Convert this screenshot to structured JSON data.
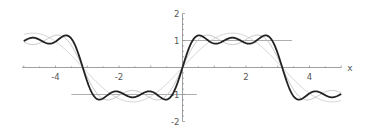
{
  "chart_data": {
    "type": "line",
    "title": "",
    "xlabel": "x",
    "ylabel": "",
    "xlim": [
      -5.0,
      5.0
    ],
    "ylim": [
      -2,
      2
    ],
    "grid": false,
    "legend": null,
    "x_ticks": [
      -4,
      -2,
      2,
      4
    ],
    "x_tick_labels": [
      "-4",
      "-2",
      "2",
      "4"
    ],
    "y_ticks": [
      -2,
      -1,
      1,
      2
    ],
    "y_tick_labels": [
      "-2",
      "-1",
      "1",
      "2"
    ],
    "series": [
      {
        "name": "partial sum, 1 term",
        "formula": "(4/pi) sin x",
        "terms": 1,
        "color": "#cccccc",
        "width": 0.9
      },
      {
        "name": "partial sum, 2 terms",
        "formula": "(4/pi)(sin x + sin 3x / 3)",
        "terms": 2,
        "color": "#bbbbbb",
        "width": 0.9
      },
      {
        "name": "partial sum, 3 terms",
        "formula": "(4/pi)(sin x + sin 3x / 3 + sin 5x / 5)",
        "terms": 3,
        "color": "#222222",
        "width": 1.8
      }
    ],
    "reference_lines": [
      {
        "y": 1,
        "x_from": 0.0,
        "x_to": 3.45,
        "color": "#999999"
      },
      {
        "y": -1,
        "x_from": -3.5,
        "x_to": 0.45,
        "color": "#999999"
      }
    ],
    "sample_points": {
      "x": [
        -5,
        -4,
        -3,
        -2,
        -1,
        0,
        1,
        2,
        3,
        4,
        5
      ],
      "terms_3": [
        1.01,
        0.96,
        -0.5,
        -0.92,
        -0.91,
        0.0,
        0.91,
        0.92,
        0.5,
        -0.96,
        -1.01
      ]
    }
  }
}
